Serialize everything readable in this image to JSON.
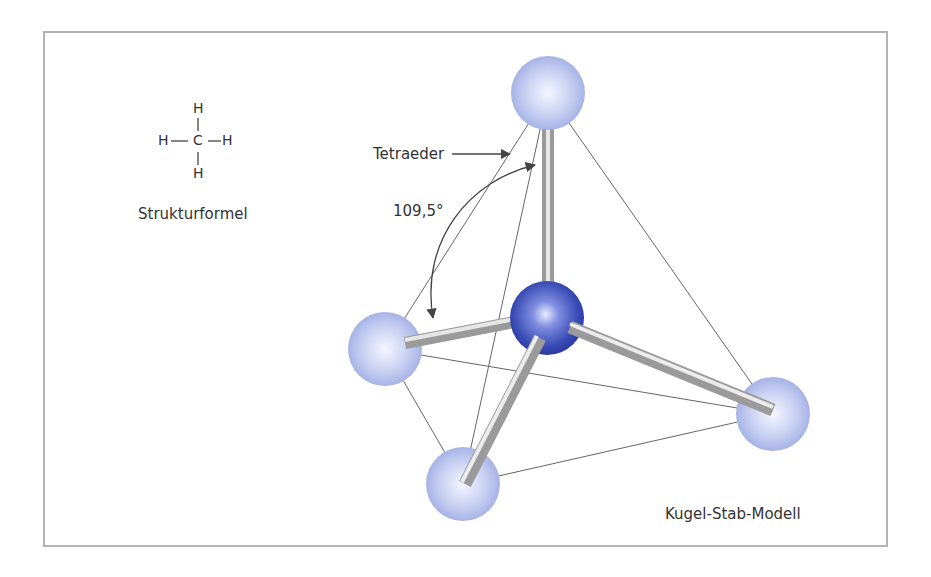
{
  "figure": {
    "structural_formula": {
      "center_atom": "C",
      "ligand_atom": "H",
      "caption": "Strukturformel"
    },
    "labels": {
      "tetrahedron": "Tetraeder",
      "bond_angle": "109,5°",
      "model_name": "Kugel-Stab-Modell"
    },
    "colors": {
      "frame": "#b4b4b4",
      "hydrogen_sphere": "#b9c3ec",
      "carbon_sphere": "#3848b0",
      "bond_stick": "#a8a8a8",
      "edge_line": "#555555"
    },
    "atoms": [
      {
        "name": "H",
        "position": "top"
      },
      {
        "name": "C",
        "position": "center"
      },
      {
        "name": "H",
        "position": "left"
      },
      {
        "name": "H",
        "position": "right"
      },
      {
        "name": "H",
        "position": "bottom"
      }
    ]
  }
}
